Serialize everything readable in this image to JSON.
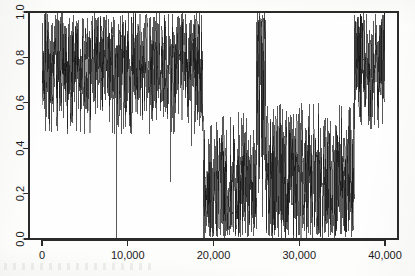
{
  "figure": {
    "background_color": "#fdfdfc",
    "ink_color": "#121212",
    "axis_color": "#2b2b2b"
  },
  "chart_data": {
    "type": "line",
    "title": "",
    "subtitle": "",
    "xlabel": "",
    "ylabel": "",
    "xlim": [
      0,
      41000
    ],
    "ylim": [
      0.0,
      1.0
    ],
    "grid": false,
    "legend": null,
    "x_tick_labels": [
      "0",
      "10,000",
      "20,000",
      "30,000",
      "40,000"
    ],
    "x_tick_values": [
      0,
      10000,
      20000,
      30000,
      40000
    ],
    "y_tick_labels": [
      "0.0",
      "0.2",
      "0.4",
      "0.6",
      "0.8",
      "1.0"
    ],
    "y_tick_values": [
      0.0,
      0.2,
      0.4,
      0.6,
      0.8,
      1.0
    ],
    "y_tick_label_rotation": -90,
    "series_name": "signal",
    "line_color": "#121212",
    "line_width": 0.45,
    "n_points_approx": 40000,
    "regimes": [
      {
        "label": "high-band-1",
        "x_start": 0,
        "x_end": 18800,
        "band_low": 0.46,
        "band_high": 1.0,
        "center": 0.72,
        "note": "broad high band, occasional deep dropouts"
      },
      {
        "label": "low-band-1",
        "x_start": 18800,
        "x_end": 25000,
        "band_low": 0.0,
        "band_high": 0.56,
        "center": 0.3,
        "note": "abrupt drop, wide low band reaching zero"
      },
      {
        "label": "spike-burst",
        "x_start": 25000,
        "x_end": 26050,
        "band_low": 0.0,
        "band_high": 1.0,
        "center": 0.55,
        "note": "brief burst returning to full scale"
      },
      {
        "label": "low-band-2",
        "x_start": 26050,
        "x_end": 36400,
        "band_low": 0.0,
        "band_high": 0.6,
        "center": 0.33,
        "note": "low band with scattered upward spikes to about 0.75"
      },
      {
        "label": "high-band-2",
        "x_start": 36400,
        "x_end": 40000,
        "band_low": 0.45,
        "band_high": 1.0,
        "center": 0.73,
        "note": "recovery to high band"
      }
    ],
    "notable_events": [
      {
        "label": "dropout-spike",
        "x": 8700,
        "y_min": 0.0,
        "note": "single deep spike to zero"
      },
      {
        "label": "dip",
        "x": 15000,
        "y_min": 0.25,
        "note": "narrow dip"
      },
      {
        "label": "dip",
        "x": 17400,
        "y_min": 0.41,
        "note": "shallow dip"
      },
      {
        "label": "regime-edge",
        "x": 18800,
        "note": "sharp transition high to low"
      },
      {
        "label": "regime-edge",
        "x": 25000,
        "note": "spike burst to full scale"
      },
      {
        "label": "regime-edge",
        "x": 36400,
        "note": "sharp transition low to high"
      }
    ]
  }
}
